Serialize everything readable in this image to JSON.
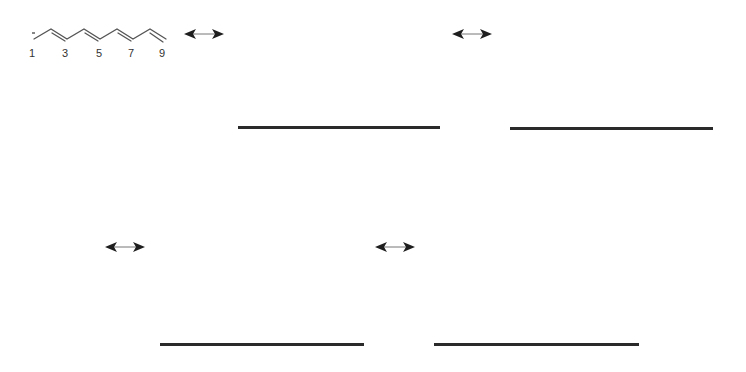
{
  "structure": {
    "name": "nonatetraenyl anion",
    "charge_symbol": "-",
    "locants": [
      "1",
      "3",
      "5",
      "7",
      "9"
    ],
    "bond_color": "#555555"
  },
  "resonance_arrows": [
    {
      "id": "arrow-1",
      "x": 182,
      "y": 27
    },
    {
      "id": "arrow-2",
      "x": 450,
      "y": 27
    },
    {
      "id": "arrow-3",
      "x": 103,
      "y": 240
    },
    {
      "id": "arrow-4",
      "x": 373,
      "y": 240
    }
  ],
  "answer_lines": [
    {
      "id": "answer-line-1",
      "x1": 238,
      "x2": 440,
      "y": 127
    },
    {
      "id": "answer-line-2",
      "x1": 510,
      "x2": 713,
      "y": 128
    },
    {
      "id": "answer-line-3",
      "x1": 160,
      "x2": 364,
      "y": 344
    },
    {
      "id": "answer-line-4",
      "x1": 434,
      "x2": 639,
      "y": 344
    }
  ],
  "colors": {
    "ink": "#2a2a2a",
    "background": "#ffffff"
  }
}
